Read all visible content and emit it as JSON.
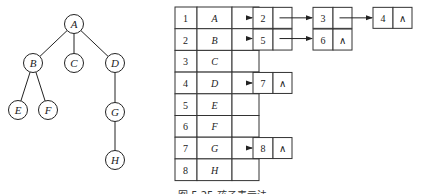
{
  "tree": {
    "nodes": [
      {
        "id": "A",
        "label": "A"
      },
      {
        "id": "B",
        "label": "B"
      },
      {
        "id": "C",
        "label": "C"
      },
      {
        "id": "D",
        "label": "D"
      },
      {
        "id": "E",
        "label": "E"
      },
      {
        "id": "F",
        "label": "F"
      },
      {
        "id": "G",
        "label": "G"
      },
      {
        "id": "H",
        "label": "H"
      }
    ],
    "edges": [
      [
        "A",
        "B"
      ],
      [
        "A",
        "C"
      ],
      [
        "A",
        "D"
      ],
      [
        "B",
        "E"
      ],
      [
        "B",
        "F"
      ],
      [
        "D",
        "G"
      ],
      [
        "G",
        "H"
      ]
    ]
  },
  "table": {
    "rows": [
      {
        "index": "1",
        "data": "A",
        "children": [
          "2",
          "3",
          "4"
        ]
      },
      {
        "index": "2",
        "data": "B",
        "children": [
          "5",
          "6"
        ]
      },
      {
        "index": "3",
        "data": "C",
        "children": []
      },
      {
        "index": "4",
        "data": "D",
        "children": [
          "7"
        ]
      },
      {
        "index": "5",
        "data": "E",
        "children": []
      },
      {
        "index": "6",
        "data": "F",
        "children": []
      },
      {
        "index": "7",
        "data": "G",
        "children": [
          "8"
        ]
      },
      {
        "index": "8",
        "data": "H",
        "children": []
      }
    ],
    "null_symbol": "∧"
  },
  "caption": "图 5.25   孩子表示法"
}
